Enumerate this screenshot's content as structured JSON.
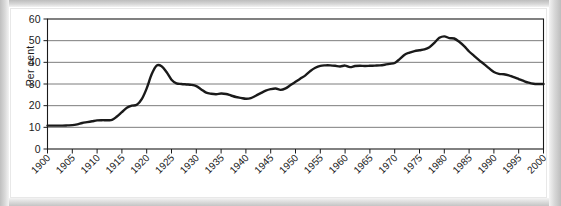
{
  "chart_data": {
    "type": "line",
    "title": "",
    "subtitle": "",
    "xlabel": "",
    "ylabel": "Per cent",
    "xlim": [
      1900,
      2000
    ],
    "ylim": [
      0,
      60
    ],
    "grid": true,
    "legend": false,
    "y_ticks": [
      0,
      10,
      20,
      30,
      40,
      50,
      60
    ],
    "x_ticks": [
      1900,
      1905,
      1910,
      1915,
      1920,
      1925,
      1930,
      1935,
      1940,
      1945,
      1950,
      1955,
      1960,
      1965,
      1970,
      1975,
      1980,
      1985,
      1990,
      1995,
      2000
    ],
    "x_tick_labels": [
      "1900",
      "1905",
      "1910",
      "1915",
      "1920",
      "1925",
      "1930",
      "1935",
      "1940",
      "1945",
      "1950",
      "1955",
      "1960",
      "1965",
      "1970",
      "1975",
      "1980",
      "1985",
      "1990",
      "1995",
      "2000"
    ],
    "y_tick_labels": [
      "0",
      "10",
      "20",
      "30",
      "40",
      "50",
      "60"
    ],
    "x_tick_label_rotation": -45,
    "series": [
      {
        "name": "Per cent",
        "color": "#1a1a1a",
        "line_width": 2.4,
        "x": [
          1900,
          1901,
          1902,
          1903,
          1904,
          1905,
          1906,
          1907,
          1908,
          1909,
          1910,
          1911,
          1912,
          1913,
          1914,
          1915,
          1916,
          1917,
          1918,
          1919,
          1920,
          1921,
          1922,
          1923,
          1924,
          1925,
          1926,
          1927,
          1928,
          1929,
          1930,
          1931,
          1932,
          1933,
          1934,
          1935,
          1936,
          1937,
          1938,
          1939,
          1940,
          1941,
          1942,
          1943,
          1944,
          1945,
          1946,
          1947,
          1948,
          1949,
          1950,
          1951,
          1952,
          1953,
          1954,
          1955,
          1956,
          1957,
          1958,
          1959,
          1960,
          1961,
          1962,
          1963,
          1964,
          1965,
          1966,
          1967,
          1968,
          1969,
          1970,
          1971,
          1972,
          1973,
          1974,
          1975,
          1976,
          1977,
          1978,
          1979,
          1980,
          1981,
          1982,
          1983,
          1984,
          1985,
          1986,
          1987,
          1988,
          1989,
          1990,
          1991,
          1992,
          1993,
          1994,
          1995,
          1996,
          1997,
          1998,
          1999,
          2000
        ],
        "y": [
          10.8,
          10.8,
          10.8,
          10.8,
          10.9,
          11.0,
          11.4,
          12.0,
          12.4,
          12.8,
          13.2,
          13.3,
          13.3,
          13.4,
          15.0,
          17.0,
          19.0,
          20.0,
          20.4,
          23.0,
          28.0,
          34.5,
          38.5,
          38.2,
          35.5,
          32.0,
          30.3,
          30.0,
          29.8,
          29.6,
          29.0,
          27.5,
          26.0,
          25.5,
          25.3,
          25.6,
          25.4,
          24.7,
          24.0,
          23.6,
          23.2,
          23.5,
          24.6,
          25.8,
          26.9,
          27.6,
          27.9,
          27.3,
          28.0,
          29.5,
          31.0,
          32.5,
          34.0,
          36.0,
          37.5,
          38.4,
          38.6,
          38.6,
          38.4,
          38.1,
          38.5,
          37.8,
          38.3,
          38.4,
          38.3,
          38.4,
          38.5,
          38.6,
          38.9,
          39.3,
          39.7,
          41.5,
          43.5,
          44.5,
          45.2,
          45.6,
          46.0,
          47.0,
          49.0,
          51.3,
          52.0,
          51.2,
          51.0,
          49.5,
          47.5,
          45.0,
          43.0,
          41.0,
          39.2,
          37.3,
          35.5,
          34.7,
          34.5,
          34.0,
          33.2,
          32.3,
          31.4,
          30.6,
          30.1,
          30.0,
          30.0
        ]
      }
    ]
  },
  "figure": {
    "y_axis_title": "Per cent"
  }
}
